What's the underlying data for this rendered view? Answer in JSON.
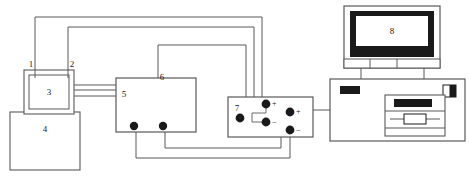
{
  "figure": {
    "kind": "schematic-diagram",
    "title": "",
    "background_color": "#ffffff",
    "line_color": "#4d4d4d",
    "dark_fill": "#1a1a1a",
    "label_color": "#1a1a1a",
    "width": 469,
    "height": 185
  },
  "labels": {
    "one": "1",
    "two": "2",
    "three": "3",
    "four": "4",
    "five": "5",
    "six": "6",
    "seven": "7",
    "eight": "8"
  },
  "components": [
    {
      "id": "comp-1",
      "label": "1",
      "role": "inlet-port-upper-left"
    },
    {
      "id": "comp-2",
      "label": "2",
      "role": "inlet-port-upper-right"
    },
    {
      "id": "comp-3",
      "label": "3",
      "role": "reaction-cell"
    },
    {
      "id": "comp-4",
      "label": "4",
      "role": "base-vessel"
    },
    {
      "id": "comp-5",
      "label": "5",
      "role": "tube-connection-port"
    },
    {
      "id": "comp-6",
      "label": "6",
      "role": "instrument-module"
    },
    {
      "id": "comp-7",
      "label": "7",
      "role": "power-supply-terminal-panel"
    },
    {
      "id": "comp-8",
      "label": "8",
      "role": "computer-monitor-display"
    }
  ],
  "terminals": {
    "module_bottom": [
      {
        "name": "module-terminal-left",
        "x": 134,
        "y": 126
      },
      {
        "name": "module-terminal-right",
        "x": 163,
        "y": 126
      }
    ],
    "power_panel": [
      {
        "name": "power-terminal-plain",
        "x": 240,
        "y": 118,
        "sign": ""
      },
      {
        "name": "power-terminal-pos-1",
        "x": 266,
        "y": 104,
        "sign": "+"
      },
      {
        "name": "power-terminal-neg-1",
        "x": 266,
        "y": 122,
        "sign": "−"
      },
      {
        "name": "power-terminal-pos-2",
        "x": 290,
        "y": 112,
        "sign": "+"
      },
      {
        "name": "power-terminal-neg-2",
        "x": 290,
        "y": 130,
        "sign": "−"
      }
    ]
  },
  "signs": {
    "plus": "+",
    "minus": "−"
  }
}
